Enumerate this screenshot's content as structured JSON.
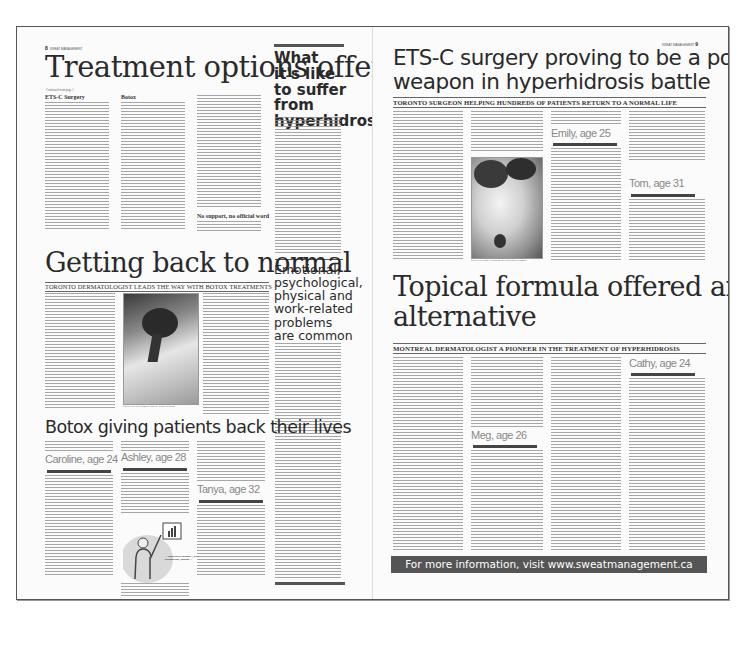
{
  "document": {
    "type": "newspaper advertorial spread",
    "left_page": {
      "folio_number": "8",
      "folio_label": "SWEAT MANAGEMENT",
      "main_story": {
        "headline": "Treatment options offer hope",
        "byline": "Continued from page 1",
        "subheads": [
          "ETS-C Surgery",
          "Botox",
          "No support, no official word"
        ]
      },
      "sidebar": {
        "headline": "What it's like to suffer from hyperhidrosis",
        "second_headline": "Emotional, psychological, physical and work-related problems are common"
      },
      "second_story": {
        "headline": "Getting back to normal",
        "deck": "Toronto dermatologist leads the way with Botox treatments",
        "photo_caption": "Patient receives treatment from Dr. Benoit Bertrand"
      },
      "third_story": {
        "headline": "Botox giving patients back their lives",
        "profiles": [
          "Caroline, age 24",
          "Ashley, age 28",
          "Tanya, age 32"
        ],
        "illustration_caption": "\"...could barely manage..., avoid... presentations, shaking...\""
      }
    },
    "right_page": {
      "folio_number": "9",
      "folio_label": "SWEAT MANAGEMENT",
      "main_story": {
        "headline_line1": "ETS-C surgery proving to be a powerful",
        "headline_line2": "weapon in hyperhidrosis battle",
        "deck": "Toronto surgeon helping hundreds of patients return to a normal life",
        "profiles": [
          "Emily, age 25",
          "Tom, age 31"
        ],
        "photo_caption": "Sweat is no longer a problem after successful treatment"
      },
      "second_story": {
        "headline_line1": "Topical formula offered another",
        "headline_line2": "alternative",
        "deck": "Montreal dermatologist a pioneer in the treatment of hyperhidrosis",
        "profiles": [
          "Cathy, age 24",
          "Meg, age 26"
        ]
      },
      "footer": {
        "text": "For more information, visit www.sweatmanagement.ca",
        "background_color": "#555555"
      }
    }
  }
}
